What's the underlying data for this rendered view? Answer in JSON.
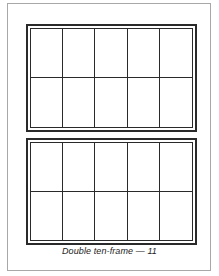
{
  "document": {
    "caption": "Double ten-frame — 11",
    "frames": [
      {
        "id": "frame-1",
        "rows": 2,
        "columns": 5,
        "filled_cells": 0
      },
      {
        "id": "frame-2",
        "rows": 2,
        "columns": 5,
        "filled_cells": 0
      }
    ],
    "colors": {
      "line": "#2a2a2a",
      "page_border": "#a8a8a8",
      "background": "#ffffff"
    }
  }
}
